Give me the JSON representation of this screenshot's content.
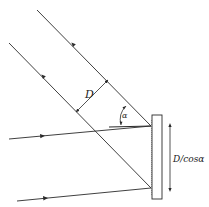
{
  "diagram": {
    "labels": {
      "beam_width": "D",
      "angle": "α",
      "mirror_length": "D/cosα"
    },
    "colors": {
      "line": "#2a2a2a",
      "background": "#ffffff"
    },
    "elements": {
      "mirror": {
        "x": 152,
        "y": 115,
        "width": 10,
        "height": 84
      },
      "incoming_beams": [
        {
          "from": [
            9,
            139
          ],
          "to": [
            151,
            126
          ],
          "arrow_at": [
            42,
            136
          ]
        },
        {
          "from": [
            17,
            201
          ],
          "to": [
            151,
            188
          ],
          "arrow_at": [
            45,
            198
          ]
        }
      ],
      "reflected_beams": [
        {
          "from": [
            151,
            126
          ],
          "to": [
            37,
            10
          ],
          "arrow_at": [
            73,
            47
          ]
        },
        {
          "from": [
            151,
            188
          ],
          "to": [
            9,
            43
          ],
          "arrow_at": [
            43,
            79
          ]
        }
      ]
    }
  }
}
